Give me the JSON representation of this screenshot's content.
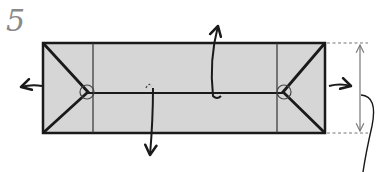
{
  "step": {
    "number": "5"
  },
  "diagram": {
    "type": "origami-fold-instruction",
    "colors": {
      "paper_fill": "#d6d6d6",
      "outline": "#1a1a1a",
      "thin_line": "#555555",
      "dim_line": "#777777",
      "step_number": "#8a8a8a"
    },
    "elements": {
      "paper_rectangle": "gray paper rectangle",
      "left_crease": "vertical crease left",
      "right_crease": "vertical crease right",
      "center_line": "horizontal center fold",
      "left_point_marker": "circle marker left",
      "right_point_marker": "circle marker right",
      "arrow_left": "pull left",
      "arrow_right": "pull right",
      "arrow_up": "fold up flap",
      "arrow_down": "fold down flap",
      "height_dimension": "height indicator"
    }
  }
}
